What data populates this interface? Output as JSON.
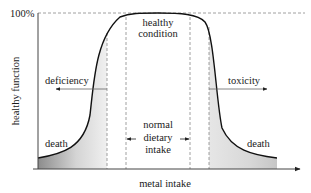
{
  "diagram": {
    "type": "dose-response curve",
    "y_axis": {
      "label": "healthy function",
      "top_tick": "100%"
    },
    "x_axis": {
      "label": "metal intake"
    },
    "regions": {
      "center_top": {
        "line1": "healthy",
        "line2": "condition"
      },
      "center_mid": {
        "line1": "normal",
        "line2": "dietary",
        "line3": "intake"
      },
      "left_arrow": "deficiency",
      "right_arrow": "toxicity",
      "left_bottom": "death",
      "right_bottom": "death"
    },
    "colors": {
      "curve": "#111111",
      "axis": "#444444",
      "dashed": "#888888",
      "shade_dark": "#9a9a9a",
      "shade_light": "#f2f2f2"
    }
  }
}
